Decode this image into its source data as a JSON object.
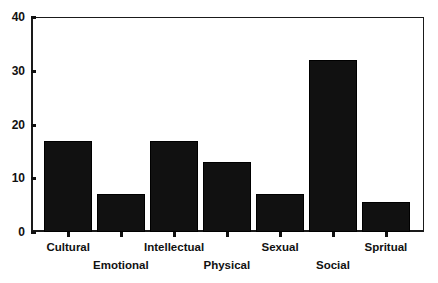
{
  "chart_data": {
    "type": "bar",
    "title": "",
    "subtitle": "",
    "xlabel": "",
    "ylabel": "",
    "categories": [
      "Cultural",
      "Emotional",
      "Intellectual",
      "Physical",
      "Sexual",
      "Social",
      "Spritual"
    ],
    "values": [
      17,
      7,
      17,
      13,
      7,
      32,
      5.5
    ],
    "ylim": [
      0,
      40
    ],
    "yticks": [
      0,
      10,
      20,
      30,
      40
    ],
    "ytick_labels": [
      "0",
      "10",
      "20",
      "30",
      "40"
    ],
    "xlim_note": "categorical",
    "grid": false,
    "legend": null,
    "legend_position": "none",
    "bar_color": "#111111",
    "axis_color": "#111111",
    "background_color": "#ffffff",
    "label_rows": [
      0,
      1,
      0,
      1,
      0,
      1,
      0
    ],
    "annotations": []
  }
}
